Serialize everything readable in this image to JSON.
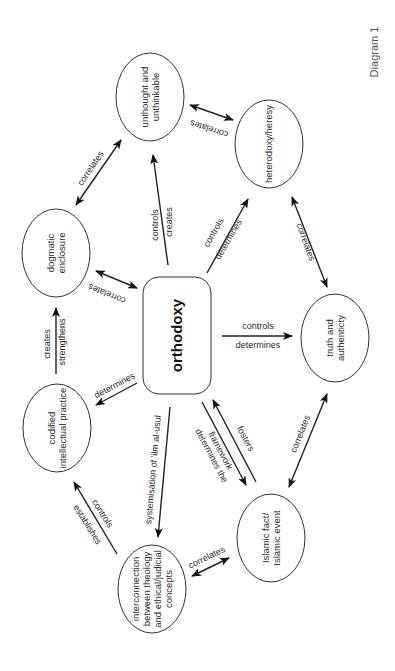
{
  "caption": "Diagram 1",
  "core": {
    "id": "orthodoxy",
    "label": "orthodoxy",
    "x": 143,
    "y": 277,
    "w": 68,
    "h": 117,
    "r": 16
  },
  "nodes": [
    {
      "id": "unthought",
      "lines": [
        "unthought and",
        "unthinkable"
      ],
      "cx": 150,
      "cy": 97,
      "rx": 34,
      "ry": 44
    },
    {
      "id": "heterodoxy",
      "lines": [
        "heterodoxy/heresy"
      ],
      "cx": 269,
      "cy": 144,
      "rx": 34,
      "ry": 44
    },
    {
      "id": "dogmatic",
      "lines": [
        "dogmatic",
        "enclosure"
      ],
      "cx": 56,
      "cy": 253,
      "rx": 34,
      "ry": 44
    },
    {
      "id": "truth",
      "lines": [
        "truth and",
        "authenticty"
      ],
      "cx": 335,
      "cy": 338,
      "rx": 34,
      "ry": 44
    },
    {
      "id": "codified",
      "lines": [
        "codified",
        "intellectual practice"
      ],
      "cx": 57,
      "cy": 428,
      "rx": 34,
      "ry": 44
    },
    {
      "id": "islamic",
      "lines": [
        "Islamic fact/",
        "Islamic event"
      ],
      "cx": 271,
      "cy": 538,
      "rx": 34,
      "ry": 44
    },
    {
      "id": "interconnection",
      "lines": [
        "interconnection",
        "between theology",
        "and ethical/judicial",
        "concepts"
      ],
      "cx": 152,
      "cy": 589,
      "rx": 34,
      "ry": 44
    }
  ],
  "edges": [
    {
      "id": "unthought-heterodoxy",
      "x1": 190,
      "y1": 105,
      "x2": 233,
      "y2": 120,
      "start": true,
      "end": true,
      "labels": [
        {
          "text": "correlates",
          "x": 210,
          "y": 126,
          "rot": 198
        }
      ]
    },
    {
      "id": "dogmatic-unthought",
      "x1": 76,
      "y1": 205,
      "x2": 121,
      "y2": 140,
      "start": true,
      "end": true,
      "labels": [
        {
          "text": "correlates",
          "x": 93,
          "y": 170,
          "rot": -56
        }
      ]
    },
    {
      "id": "orthodoxy-unthought",
      "x1": 168,
      "y1": 265,
      "x2": 153,
      "y2": 155,
      "start": false,
      "end": true,
      "labels": [
        {
          "text": "controls",
          "x": 158,
          "y": 225,
          "rot": -90
        },
        {
          "text": "creates",
          "x": 172,
          "y": 222,
          "rot": -90
        }
      ]
    },
    {
      "id": "orthodoxy-heterodoxy",
      "x1": 207,
      "y1": 273,
      "x2": 248,
      "y2": 199,
      "start": false,
      "end": true,
      "labels": [
        {
          "text": "controls",
          "x": 216,
          "y": 234,
          "rot": -60
        },
        {
          "text": "determines",
          "x": 231,
          "y": 241,
          "rot": -60
        }
      ]
    },
    {
      "id": "heterodoxy-truth",
      "x1": 292,
      "y1": 197,
      "x2": 327,
      "y2": 287,
      "start": true,
      "end": true,
      "labels": [
        {
          "text": "correlates",
          "x": 303,
          "y": 243,
          "rot": 70
        }
      ]
    },
    {
      "id": "dogmatic-orthodoxy",
      "x1": 96,
      "y1": 271,
      "x2": 137,
      "y2": 288,
      "start": true,
      "end": true,
      "labels": [
        {
          "text": "correlates",
          "x": 108,
          "y": 291,
          "rot": 202
        }
      ]
    },
    {
      "id": "orthodoxy-truth",
      "x1": 222,
      "y1": 336,
      "x2": 292,
      "y2": 336,
      "start": false,
      "end": true,
      "labels": [
        {
          "text": "controls",
          "x": 258,
          "y": 329,
          "rot": 0
        },
        {
          "text": "determines",
          "x": 258,
          "y": 348,
          "rot": 0
        }
      ]
    },
    {
      "id": "codified-dogmatic",
      "x1": 56,
      "y1": 374,
      "x2": 56,
      "y2": 308,
      "start": false,
      "end": true,
      "labels": [
        {
          "text": "creates",
          "x": 50,
          "y": 344,
          "rot": -90
        },
        {
          "text": "strengthens",
          "x": 65,
          "y": 342,
          "rot": -90
        }
      ]
    },
    {
      "id": "orthodoxy-codified",
      "x1": 137,
      "y1": 383,
      "x2": 96,
      "y2": 405,
      "start": false,
      "end": true,
      "labels": [
        {
          "text": "determines",
          "x": 116,
          "y": 388,
          "rot": -28
        }
      ]
    },
    {
      "id": "orthodoxy-interconnection",
      "x1": 170,
      "y1": 407,
      "x2": 158,
      "y2": 537,
      "start": false,
      "end": true,
      "labels": [
        {
          "text": "systemisation of 'ilm al-usul",
          "x": 156,
          "y": 470,
          "rot": -85
        }
      ]
    },
    {
      "id": "orthodoxy-islamic",
      "x1": 202,
      "y1": 402,
      "x2": 246,
      "y2": 485,
      "start": false,
      "end": true,
      "labels": [
        {
          "text": "determines the",
          "x": 209,
          "y": 457,
          "rot": 62
        },
        {
          "text": "framework",
          "x": 218,
          "y": 452,
          "rot": 62
        }
      ]
    },
    {
      "id": "islamic-orthodoxy",
      "x1": 256,
      "y1": 482,
      "x2": 213,
      "y2": 400,
      "start": false,
      "end": true,
      "labels": [
        {
          "text": "fosters",
          "x": 243,
          "y": 440,
          "rot": 62
        }
      ]
    },
    {
      "id": "truth-islamic",
      "x1": 327,
      "y1": 394,
      "x2": 289,
      "y2": 487,
      "start": true,
      "end": true,
      "labels": [
        {
          "text": "correlates",
          "x": 303,
          "y": 435,
          "rot": -68
        }
      ]
    },
    {
      "id": "interconnection-codified",
      "x1": 117,
      "y1": 554,
      "x2": 74,
      "y2": 482,
      "start": false,
      "end": true,
      "labels": [
        {
          "text": "establishes",
          "x": 85,
          "y": 526,
          "rot": 58
        },
        {
          "text": "controls",
          "x": 100,
          "y": 515,
          "rot": 58
        }
      ]
    },
    {
      "id": "interconnection-islamic",
      "x1": 192,
      "y1": 576,
      "x2": 229,
      "y2": 558,
      "start": true,
      "end": true,
      "labels": [
        {
          "text": "correlates",
          "x": 208,
          "y": 560,
          "rot": -26
        }
      ]
    }
  ],
  "colors": {
    "stroke": "#222222",
    "text": "#2a2a2a",
    "background": "#ffffff"
  }
}
